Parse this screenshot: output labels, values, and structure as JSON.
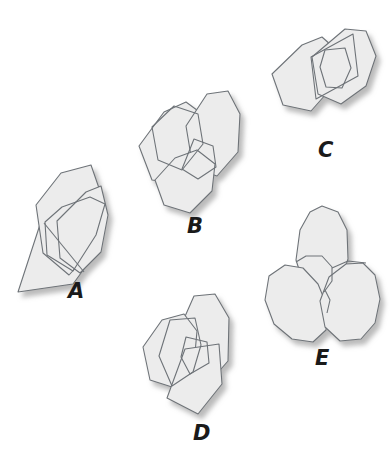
{
  "image": {
    "title": "Overlapping polygon figures puzzle",
    "background_color": "#ffffff",
    "width": 392,
    "height": 471
  },
  "style": {
    "shape_fill": "#ececec",
    "shape_stroke": "#6e7378",
    "shadow_color": "#c9c9c9",
    "label_color": "#1a1a1a",
    "stroke_width": 1.1
  },
  "figures": [
    {
      "id": "A",
      "label": "A",
      "description": "Three overlapping polygons: a large tilted hexagon, a pointed quadrilateral wedge, and an outlined hexagon overlay",
      "shape_count": 3
    },
    {
      "id": "B",
      "label": "B",
      "description": "Three overlapping polygons: two large hexagons side by side with a smaller pentagon outline at the junction",
      "shape_count": 3
    },
    {
      "id": "C",
      "label": "C",
      "description": "Three overlapping shapes: two large hexagons with a parallelogram outline crossing them",
      "shape_count": 3
    },
    {
      "id": "D",
      "label": "D",
      "description": "Three overlapping polygons: a tall hexagon, a rounded hexagon and a pentagon wedge below",
      "shape_count": 3
    },
    {
      "id": "E",
      "label": "E",
      "description": "Three overlapping rounded polygons arranged like a three-bladed pinwheel",
      "shape_count": 3
    }
  ],
  "labels": {
    "A": "A",
    "B": "B",
    "C": "C",
    "D": "D",
    "E": "E"
  }
}
